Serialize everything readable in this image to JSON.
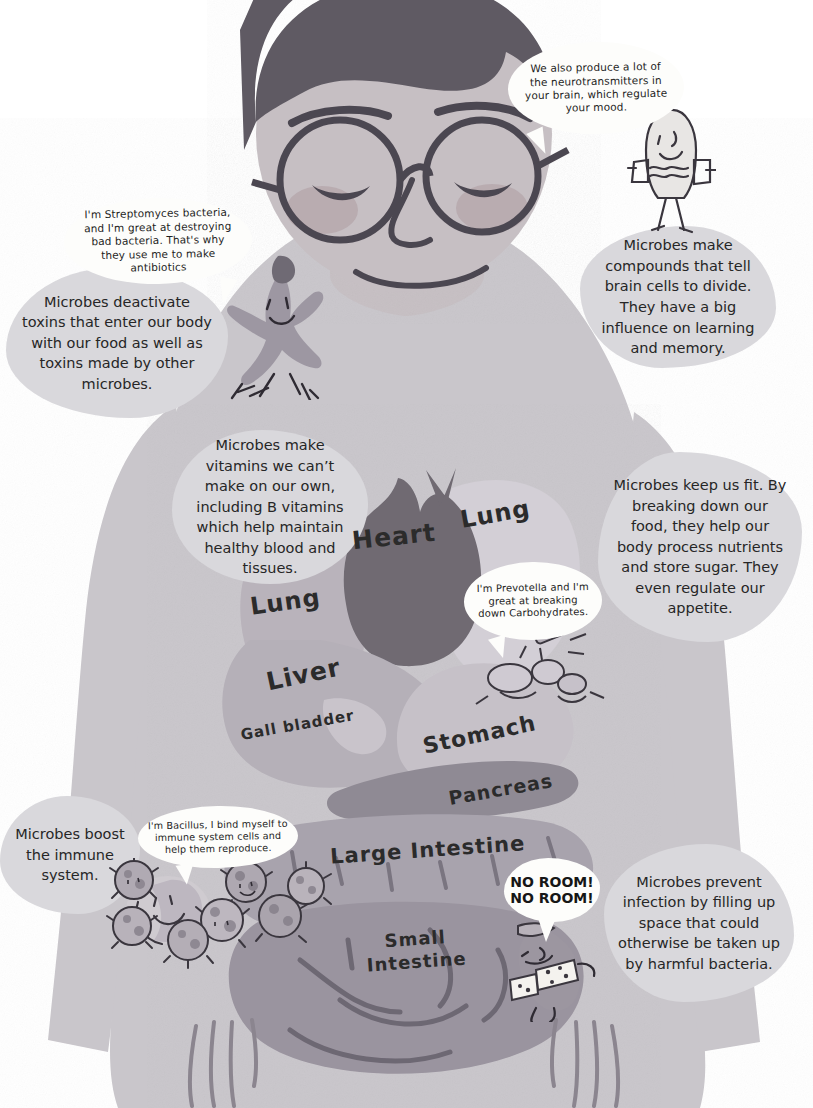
{
  "illustration": {
    "title": "Microbes in the human body",
    "subject": "Person with dark hair and round glasses, eyes closed, shown with internal organs and cartoon microbe characters"
  },
  "palette": {
    "background": "#ffffff",
    "body_fill": "#c9c6cb",
    "skin": "#c3bcc0",
    "hair": "#5f5a63",
    "callout_bg": "#d9d8dc",
    "balloon_bg": "#fdfdfb",
    "heart": "#6f6a72",
    "lung_left": "#b9b3bb",
    "lung_right": "#d3cfd6",
    "liver": "#b5b0b8",
    "stomach": "#c6c1c8",
    "pancreas": "#8f8a94",
    "large_intestine": "#a8a3ad",
    "small_intestine": "#9a949f",
    "text": "#262626"
  },
  "callouts": [
    {
      "id": "toxins",
      "name": "callout-toxins",
      "text": "Microbes deactivate toxins that enter our body with our food as well as toxins made by other microbes."
    },
    {
      "id": "brain",
      "name": "callout-brain",
      "text": "Microbes make compounds that tell brain cells to divide. They have a big influence on learning and memory."
    },
    {
      "id": "vitamins",
      "name": "callout-vitamins",
      "text": "Microbes make vitamins we can’t make on our own, including B vitamins which help maintain healthy blood and tissues."
    },
    {
      "id": "fitness",
      "name": "callout-fitness",
      "text": "Microbes keep us fit. By breaking down our food, they help our body process nutrients and store sugar. They even regulate our appetite."
    },
    {
      "id": "immune",
      "name": "callout-immune",
      "text": "Microbes boost the immune system."
    },
    {
      "id": "infection",
      "name": "callout-infection",
      "text": "Microbes prevent infection by filling up space that could otherwise be taken up by harmful bacteria."
    }
  ],
  "speech_balloons": [
    {
      "id": "streptomyces",
      "name": "balloon-streptomyces",
      "text": "I'm Streptomyces bacteria, and I'm great at destroying bad bacteria. That's why they use me to make antibiotics"
    },
    {
      "id": "neurotransmitters",
      "name": "balloon-neurotransmitters",
      "text": "We also produce a lot of the neurotransmitters in your brain, which regulate your mood."
    },
    {
      "id": "prevotella",
      "name": "balloon-prevotella",
      "text": "I'm Prevotella and I'm great at breaking down Carbohydrates."
    },
    {
      "id": "bacillus",
      "name": "balloon-bacillus",
      "text": "I'm Bacillus, I bind myself to immune system cells and help them reproduce."
    }
  ],
  "shout": {
    "name": "balloon-no-room",
    "line1": "NO ROOM!",
    "line2": "NO ROOM!"
  },
  "organ_labels": [
    {
      "id": "lung-right",
      "text": "Lung"
    },
    {
      "id": "heart",
      "text": "Heart"
    },
    {
      "id": "lung-left",
      "text": "Lung"
    },
    {
      "id": "liver",
      "text": "Liver"
    },
    {
      "id": "gall-bladder",
      "text": "Gall bladder"
    },
    {
      "id": "stomach",
      "text": "Stomach"
    },
    {
      "id": "pancreas",
      "text": "Pancreas"
    },
    {
      "id": "large-intestine",
      "text": "Large  Intestine"
    },
    {
      "id": "small-intestine-1",
      "text": "Small"
    },
    {
      "id": "small-intestine-2",
      "text": "Intestine"
    }
  ],
  "characters": [
    {
      "id": "streptomyces-figure",
      "name": "microbe-streptomyces-character"
    },
    {
      "id": "neurotransmitter-figure",
      "name": "microbe-neurotransmitter-character"
    },
    {
      "id": "prevotella-figure",
      "name": "microbe-prevotella-character"
    },
    {
      "id": "bacillus-cluster",
      "name": "microbe-bacillus-cluster"
    },
    {
      "id": "no-room-figure",
      "name": "microbe-no-room-character"
    }
  ]
}
